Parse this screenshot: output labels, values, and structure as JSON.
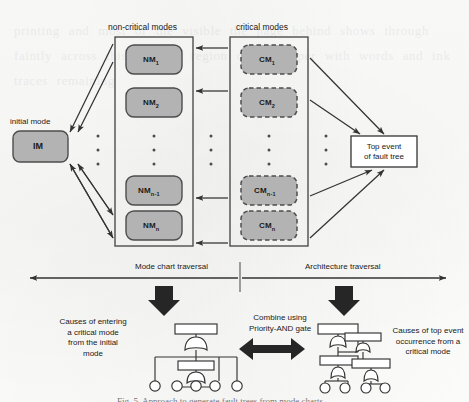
{
  "figure": {
    "type": "mode-chart-and-fault-tree-diagram",
    "caption": "Fig. 5.  Approach to generate fault trees from mode charts"
  },
  "colors": {
    "node_fill": "#b3b3b3",
    "node_stroke": "#4d4d4d",
    "container_stroke": "#4d4d4d",
    "line": "#333333",
    "text": "#1a1a1a",
    "page_bg": "#fdfdfc"
  },
  "upper": {
    "initial_mode_label": "initial mode",
    "initial_mode_node": "IM",
    "noncritical_title": "non-critical modes",
    "critical_title": "critical modes",
    "noncritical_nodes": [
      {
        "base": "NM",
        "sub": "1"
      },
      {
        "base": "NM",
        "sub": "2"
      },
      {
        "base": "NM",
        "sub": "n-1"
      },
      {
        "base": "NM",
        "sub": "n"
      }
    ],
    "critical_nodes": [
      {
        "base": "CM",
        "sub": "1"
      },
      {
        "base": "CM",
        "sub": "2"
      },
      {
        "base": "CM",
        "sub": "n-1"
      },
      {
        "base": "CM",
        "sub": "n"
      }
    ],
    "ellipsis_glyph": "•",
    "top_event": "Top event\nof fault tree",
    "top_event_line1": "Top event",
    "top_event_line2": "of fault tree"
  },
  "lower": {
    "left_traversal_label": "Mode chart traversal",
    "right_traversal_label": "Architecture traversal",
    "left_description": "Causes of entering\na critical mode\nfrom the initial\nmode",
    "left_description_lines": [
      "Causes of entering",
      "a critical mode",
      "from the initial",
      "mode"
    ],
    "combine_label": "Combine using\nPriority-AND gate",
    "combine_label_lines": [
      "Combine using",
      "Priority-AND gate"
    ],
    "right_description": "Causes of top event\noccurrence from a\ncritical mode",
    "right_description_lines": [
      "Causes of top event",
      "occurrence from a",
      "critical mode"
    ]
  },
  "ghost": {
    "bleed_text": "printing and most of the visible the page behind shows through faintly across this scanned region of the paper with words and ink traces remaining"
  }
}
